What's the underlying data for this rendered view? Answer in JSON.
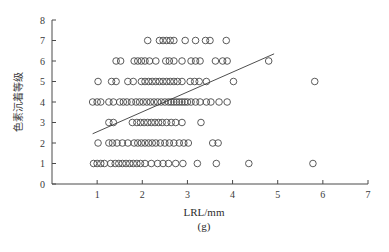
{
  "chart_data": {
    "type": "scatter",
    "title": "",
    "subtitle": "",
    "xlabel": "LRL/mm",
    "ylabel": "色素沉着等级",
    "subcaption": "(g)",
    "xlim": [
      0,
      7
    ],
    "ylim": [
      0,
      8
    ],
    "xticks": [
      1,
      2,
      3,
      4,
      5,
      6,
      7
    ],
    "yticks": [
      0,
      1,
      2,
      3,
      4,
      5,
      6,
      7,
      8
    ],
    "xtick_labels": [
      "1",
      "2",
      "3",
      "4",
      "5",
      "6",
      "7"
    ],
    "ytick_labels": [
      "0",
      "1",
      "2",
      "3",
      "4",
      "5",
      "6",
      "7",
      "8"
    ],
    "grid": false,
    "legend": null,
    "marker_style": "open-circle",
    "marker_color": "#4a4a4a",
    "line_color": "#3a3a3a",
    "trendline": {
      "label": "linear fit",
      "x_start": 0.9,
      "y_start": 2.45,
      "x_end": 4.92,
      "y_end": 6.35,
      "slope": 0.97,
      "intercept": 1.58
    },
    "points": [
      {
        "x": 2.12,
        "y": 7
      },
      {
        "x": 2.38,
        "y": 7
      },
      {
        "x": 2.46,
        "y": 7
      },
      {
        "x": 2.54,
        "y": 7
      },
      {
        "x": 2.62,
        "y": 7
      },
      {
        "x": 2.7,
        "y": 7
      },
      {
        "x": 2.95,
        "y": 7
      },
      {
        "x": 3.18,
        "y": 7
      },
      {
        "x": 3.4,
        "y": 7
      },
      {
        "x": 3.5,
        "y": 7
      },
      {
        "x": 3.86,
        "y": 7
      },
      {
        "x": 1.42,
        "y": 6
      },
      {
        "x": 1.52,
        "y": 6
      },
      {
        "x": 1.82,
        "y": 6
      },
      {
        "x": 1.9,
        "y": 6
      },
      {
        "x": 1.98,
        "y": 6
      },
      {
        "x": 2.06,
        "y": 6
      },
      {
        "x": 2.16,
        "y": 6
      },
      {
        "x": 2.3,
        "y": 6
      },
      {
        "x": 2.52,
        "y": 6
      },
      {
        "x": 2.6,
        "y": 6
      },
      {
        "x": 2.7,
        "y": 6
      },
      {
        "x": 2.88,
        "y": 6
      },
      {
        "x": 3.08,
        "y": 6
      },
      {
        "x": 3.18,
        "y": 6
      },
      {
        "x": 3.28,
        "y": 6
      },
      {
        "x": 3.62,
        "y": 6
      },
      {
        "x": 3.78,
        "y": 6
      },
      {
        "x": 3.88,
        "y": 6
      },
      {
        "x": 4.8,
        "y": 6
      },
      {
        "x": 1.02,
        "y": 5
      },
      {
        "x": 1.32,
        "y": 5
      },
      {
        "x": 1.42,
        "y": 5
      },
      {
        "x": 1.68,
        "y": 5
      },
      {
        "x": 1.8,
        "y": 5
      },
      {
        "x": 1.98,
        "y": 5
      },
      {
        "x": 2.06,
        "y": 5
      },
      {
        "x": 2.14,
        "y": 5
      },
      {
        "x": 2.22,
        "y": 5
      },
      {
        "x": 2.3,
        "y": 5
      },
      {
        "x": 2.38,
        "y": 5
      },
      {
        "x": 2.46,
        "y": 5
      },
      {
        "x": 2.54,
        "y": 5
      },
      {
        "x": 2.62,
        "y": 5
      },
      {
        "x": 2.7,
        "y": 5
      },
      {
        "x": 2.78,
        "y": 5
      },
      {
        "x": 2.88,
        "y": 5
      },
      {
        "x": 3.06,
        "y": 5
      },
      {
        "x": 3.16,
        "y": 5
      },
      {
        "x": 3.26,
        "y": 5
      },
      {
        "x": 3.42,
        "y": 5
      },
      {
        "x": 4.02,
        "y": 5
      },
      {
        "x": 5.82,
        "y": 5
      },
      {
        "x": 0.9,
        "y": 4
      },
      {
        "x": 1.0,
        "y": 4
      },
      {
        "x": 1.08,
        "y": 4
      },
      {
        "x": 1.26,
        "y": 4
      },
      {
        "x": 1.36,
        "y": 4
      },
      {
        "x": 1.5,
        "y": 4
      },
      {
        "x": 1.58,
        "y": 4
      },
      {
        "x": 1.66,
        "y": 4
      },
      {
        "x": 1.76,
        "y": 4
      },
      {
        "x": 1.86,
        "y": 4
      },
      {
        "x": 1.94,
        "y": 4
      },
      {
        "x": 2.02,
        "y": 4
      },
      {
        "x": 2.1,
        "y": 4
      },
      {
        "x": 2.18,
        "y": 4
      },
      {
        "x": 2.26,
        "y": 4
      },
      {
        "x": 2.34,
        "y": 4
      },
      {
        "x": 2.42,
        "y": 4
      },
      {
        "x": 2.5,
        "y": 4
      },
      {
        "x": 2.58,
        "y": 4
      },
      {
        "x": 2.64,
        "y": 4
      },
      {
        "x": 2.7,
        "y": 4
      },
      {
        "x": 2.76,
        "y": 4
      },
      {
        "x": 2.82,
        "y": 4
      },
      {
        "x": 2.88,
        "y": 4
      },
      {
        "x": 2.94,
        "y": 4
      },
      {
        "x": 3.0,
        "y": 4
      },
      {
        "x": 3.08,
        "y": 4
      },
      {
        "x": 3.18,
        "y": 4
      },
      {
        "x": 3.28,
        "y": 4
      },
      {
        "x": 3.42,
        "y": 4
      },
      {
        "x": 3.52,
        "y": 4
      },
      {
        "x": 3.7,
        "y": 4
      },
      {
        "x": 3.88,
        "y": 4
      },
      {
        "x": 1.26,
        "y": 3
      },
      {
        "x": 1.36,
        "y": 3
      },
      {
        "x": 1.78,
        "y": 3
      },
      {
        "x": 1.88,
        "y": 3
      },
      {
        "x": 1.96,
        "y": 3
      },
      {
        "x": 2.04,
        "y": 3
      },
      {
        "x": 2.12,
        "y": 3
      },
      {
        "x": 2.2,
        "y": 3
      },
      {
        "x": 2.28,
        "y": 3
      },
      {
        "x": 2.36,
        "y": 3
      },
      {
        "x": 2.44,
        "y": 3
      },
      {
        "x": 2.54,
        "y": 3
      },
      {
        "x": 2.64,
        "y": 3
      },
      {
        "x": 2.74,
        "y": 3
      },
      {
        "x": 2.88,
        "y": 3
      },
      {
        "x": 3.3,
        "y": 3
      },
      {
        "x": 1.02,
        "y": 2
      },
      {
        "x": 1.26,
        "y": 2
      },
      {
        "x": 1.34,
        "y": 2
      },
      {
        "x": 1.44,
        "y": 2
      },
      {
        "x": 1.56,
        "y": 2
      },
      {
        "x": 1.68,
        "y": 2
      },
      {
        "x": 1.82,
        "y": 2
      },
      {
        "x": 1.9,
        "y": 2
      },
      {
        "x": 1.98,
        "y": 2
      },
      {
        "x": 2.06,
        "y": 2
      },
      {
        "x": 2.14,
        "y": 2
      },
      {
        "x": 2.22,
        "y": 2
      },
      {
        "x": 2.3,
        "y": 2
      },
      {
        "x": 2.4,
        "y": 2
      },
      {
        "x": 2.5,
        "y": 2
      },
      {
        "x": 2.6,
        "y": 2
      },
      {
        "x": 2.7,
        "y": 2
      },
      {
        "x": 2.82,
        "y": 2
      },
      {
        "x": 2.92,
        "y": 2
      },
      {
        "x": 3.02,
        "y": 2
      },
      {
        "x": 3.56,
        "y": 2
      },
      {
        "x": 3.68,
        "y": 2
      },
      {
        "x": 0.92,
        "y": 1
      },
      {
        "x": 1.0,
        "y": 1
      },
      {
        "x": 1.08,
        "y": 1
      },
      {
        "x": 1.16,
        "y": 1
      },
      {
        "x": 1.3,
        "y": 1
      },
      {
        "x": 1.4,
        "y": 1
      },
      {
        "x": 1.48,
        "y": 1
      },
      {
        "x": 1.56,
        "y": 1
      },
      {
        "x": 1.64,
        "y": 1
      },
      {
        "x": 1.72,
        "y": 1
      },
      {
        "x": 1.8,
        "y": 1
      },
      {
        "x": 1.88,
        "y": 1
      },
      {
        "x": 1.96,
        "y": 1
      },
      {
        "x": 2.06,
        "y": 1
      },
      {
        "x": 2.2,
        "y": 1
      },
      {
        "x": 2.34,
        "y": 1
      },
      {
        "x": 2.46,
        "y": 1
      },
      {
        "x": 2.58,
        "y": 1
      },
      {
        "x": 2.74,
        "y": 1
      },
      {
        "x": 2.9,
        "y": 1
      },
      {
        "x": 3.22,
        "y": 1
      },
      {
        "x": 3.64,
        "y": 1
      },
      {
        "x": 4.36,
        "y": 1
      },
      {
        "x": 5.78,
        "y": 1
      }
    ]
  }
}
